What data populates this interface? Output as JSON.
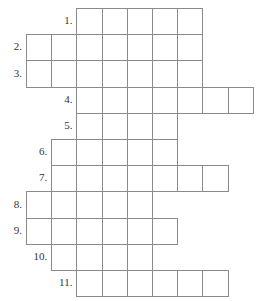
{
  "puzzle": {
    "type": "crossword-skeleton",
    "title": "",
    "total_rows": 11,
    "geometry": {
      "cell_width": 25.2,
      "cell_height": 26.2,
      "grid_origin_x": 26,
      "grid_origin_y": 8,
      "border_color": "#8a8a8a",
      "cell_fill": "#ffffff",
      "background": "#ffffff",
      "number_color": "#333333"
    },
    "rows": [
      {
        "number": "1.",
        "label": "1",
        "start_col": 2,
        "cells": 5
      },
      {
        "number": "2.",
        "label": "2",
        "start_col": 0,
        "cells": 7
      },
      {
        "number": "3.",
        "label": "3",
        "start_col": 0,
        "cells": 7
      },
      {
        "number": "4.",
        "label": "4",
        "start_col": 2,
        "cells": 7
      },
      {
        "number": "5.",
        "label": "5",
        "start_col": 2,
        "cells": 4
      },
      {
        "number": "6.",
        "label": "6",
        "start_col": 1,
        "cells": 5
      },
      {
        "number": "7.",
        "label": "7",
        "start_col": 1,
        "cells": 7
      },
      {
        "number": "8.",
        "label": "8",
        "start_col": 0,
        "cells": 5
      },
      {
        "number": "9.",
        "label": "9",
        "start_col": 0,
        "cells": 6
      },
      {
        "number": "10.",
        "label": "10",
        "start_col": 1,
        "cells": 4
      },
      {
        "number": "11.",
        "label": "11",
        "start_col": 2,
        "cells": 6
      }
    ]
  }
}
